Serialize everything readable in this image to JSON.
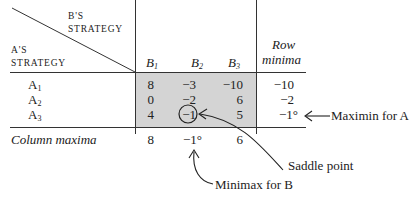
{
  "header": {
    "b_strategy_line1": "B'S",
    "b_strategy_line2": "STRATEGY",
    "a_strategy_line1": "A'S",
    "a_strategy_line2": "STRATEGY",
    "columns": [
      {
        "base": "B",
        "sub": "1"
      },
      {
        "base": "B",
        "sub": "2"
      },
      {
        "base": "B",
        "sub": "3"
      }
    ],
    "row_minima_line1": "Row",
    "row_minima_line2": "minima"
  },
  "rows": [
    {
      "base": "A",
      "sub": "1",
      "values": [
        "8",
        "−3",
        "−10"
      ],
      "row_min": "−10"
    },
    {
      "base": "A",
      "sub": "2",
      "values": [
        "0",
        "−2",
        "6"
      ],
      "row_min": "−2"
    },
    {
      "base": "A",
      "sub": "3",
      "values": [
        "4",
        "−1",
        "5"
      ],
      "row_min": "−1°"
    }
  ],
  "column_maxima": {
    "label": "Column maxima",
    "values": [
      "8",
      "−1°",
      "6"
    ]
  },
  "annotations": {
    "maximin": "Maximin for A",
    "saddle": "Saddle point",
    "minimax": "Minimax for B"
  },
  "colors": {
    "payoff_fill": "#d4d4d4",
    "ink": "#222222"
  }
}
